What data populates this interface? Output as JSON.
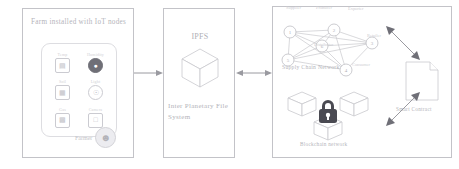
{
  "diagram": {
    "panels": {
      "farm": {
        "title": "Farm installed with IoT nodes",
        "sensors": [
          {
            "label": "Temp",
            "icon": "thermometer-icon",
            "style": "box"
          },
          {
            "label": "Humidity",
            "icon": "humidity-icon",
            "style": "solid"
          },
          {
            "label": "Soil",
            "icon": "soil-sensor-icon",
            "style": "box"
          },
          {
            "label": "Light",
            "icon": "light-sensor-icon",
            "style": "round"
          },
          {
            "label": "Gas",
            "icon": "gas-sensor-icon",
            "style": "box"
          },
          {
            "label": "Camera",
            "icon": "camera-icon",
            "style": "box"
          }
        ],
        "actor_label": "Farmer",
        "actor_icon": "farmer-avatar-icon"
      },
      "ipfs": {
        "title": "IPFS",
        "caption": "Inter Planetary File System",
        "icon": "cube-icon"
      },
      "chain": {
        "network_label": "Supply Chain Network",
        "node_labels": [
          "Supplier",
          "Producer",
          "Exporter",
          "Retailer",
          "Consumer",
          "Distributor"
        ],
        "node_numbers": [
          "1",
          "2",
          "3",
          "4",
          "5",
          "6"
        ],
        "blockchain_label": "Blockchain network",
        "blockchain_icon": "padlock-icon",
        "block_icon": "cube-icon",
        "contract_label": "Smart Contract",
        "contract_icon": "document-icon"
      }
    },
    "connectors": {
      "farm_to_ipfs": "arrow-right",
      "ipfs_to_chain": "arrow-bidirectional",
      "chain_to_contract": "arrow-bidirectional-diagonal",
      "chain_to_blockchain": "arrow-bidirectional-diagonal"
    },
    "colors": {
      "line": "#9a9aa0",
      "faint": "#c8c8cd",
      "lock": "#4a4a52",
      "background": "#ffffff"
    }
  }
}
